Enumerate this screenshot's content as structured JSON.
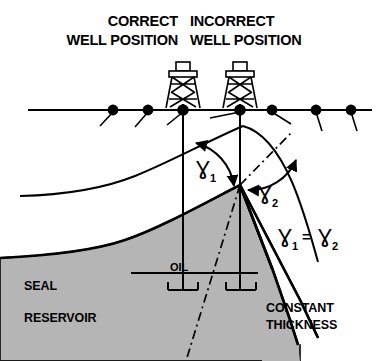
{
  "figure": {
    "title_left_line1": "CORRECT",
    "title_left_line2": "WELL POSITION",
    "title_right_line1": "INCORRECT",
    "title_right_line2": "WELL POSITION",
    "label_seal": "SEAL",
    "label_reservoir": "RESERVOIR",
    "label_oil": "OIL",
    "label_constant_line1": "CONSTANT",
    "label_constant_line2": "THICKNESS",
    "angle_1_symbol": "Ɣ",
    "angle_1_sub": "1",
    "angle_2_symbol": "Ɣ",
    "angle_2_sub": "2",
    "equation_lhs_symbol": "Ɣ",
    "equation_lhs_sub": "1",
    "equation_operator": "=",
    "equation_rhs_symbol": "Ɣ",
    "equation_rhs_sub": "2"
  },
  "colors": {
    "ink": "#000000",
    "seal_fill": "#b5b5b5",
    "seal_stroke": "#1a1a1a",
    "background": "#ffffff"
  },
  "geometry": {
    "surface_y": 110,
    "apex_x": 240,
    "apex_y": 185,
    "well_correct_x": 183,
    "well_incorrect_x": 240,
    "well_bottom_y": 290,
    "oil_contact_y": 273,
    "dip_symbol_count": 7
  }
}
